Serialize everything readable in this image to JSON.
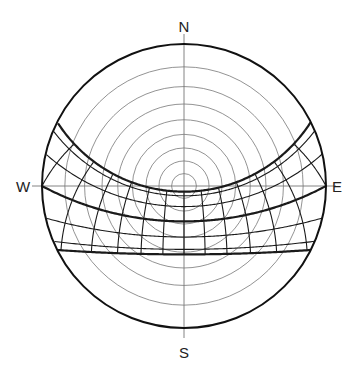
{
  "compass": {
    "north": "N",
    "south": "S",
    "east": "E",
    "west": "W"
  },
  "geometry": {
    "center": [
      184,
      186
    ],
    "radius": 142,
    "axis_extent": 152
  },
  "projection": "stereographic",
  "latitude_deg": 28,
  "altitude_rings_deg": [
    10,
    20,
    30,
    40,
    50,
    60,
    70,
    80
  ],
  "declination_curves": [
    {
      "name": "summer-solstice",
      "decl": 23.44,
      "bold": true
    },
    {
      "decl": 20.1,
      "bold": false
    },
    {
      "decl": 11.5,
      "bold": false
    },
    {
      "decl": 0,
      "name": "equinox",
      "bold": true
    },
    {
      "decl": -11.5,
      "bold": false
    },
    {
      "decl": -20.1,
      "bold": false
    },
    {
      "name": "winter-solstice",
      "decl": -23.44,
      "bold": true
    }
  ],
  "hour_angles_deg": [
    -105,
    -90,
    -75,
    -60,
    -45,
    -30,
    -15,
    0,
    15,
    30,
    45,
    60,
    75,
    90,
    105
  ],
  "colors": {
    "outline": "#111111",
    "grid": "#777777",
    "path": "#1a1a1a",
    "text": "#222222"
  }
}
